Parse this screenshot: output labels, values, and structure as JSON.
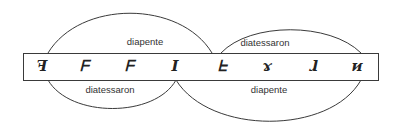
{
  "diagram": {
    "title": "",
    "colors": {
      "stroke": "#3a3a3a",
      "text": "#333333",
      "background": "#ffffff"
    },
    "notes": [
      "ꟻ",
      "ᖴ",
      "ᖴ",
      "I",
      "ᖶ",
      "ɤ",
      "ɺ",
      "ᴎ"
    ],
    "note_positions_x": [
      42,
      83,
      128,
      175,
      222,
      266,
      314,
      357
    ],
    "arcs": {
      "upper_left": {
        "label": "diapente",
        "from_note": 0,
        "to_note": 4
      },
      "upper_right": {
        "label": "diatessaron",
        "from_note": 4,
        "to_note": 7
      },
      "lower_left": {
        "label": "diatessaron",
        "from_note": 0,
        "to_note": 3
      },
      "lower_right": {
        "label": "diapente",
        "from_note": 3,
        "to_note": 7
      }
    }
  }
}
